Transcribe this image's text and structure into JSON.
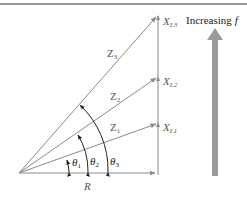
{
  "diagram": {
    "type": "phasor-impedance-diagram",
    "increasing_label": "Increasing",
    "increasing_var": "f",
    "resistance_label": "R",
    "impedances": [
      {
        "name": "Z",
        "sub": "1",
        "angle_name": "θ",
        "angle_sub": "1",
        "reactance_name": "X",
        "reactance_sub": "L1"
      },
      {
        "name": "Z",
        "sub": "2",
        "angle_name": "θ",
        "angle_sub": "2",
        "reactance_name": "X",
        "reactance_sub": "L2"
      },
      {
        "name": "Z",
        "sub": "3",
        "angle_name": "θ",
        "angle_sub": "3",
        "reactance_name": "X",
        "reactance_sub": "L3"
      }
    ],
    "colors": {
      "line": "#8a8a8a",
      "big_arrow": "#9a9a9a",
      "angle_arrow": "#222222",
      "border": "#777777"
    }
  }
}
